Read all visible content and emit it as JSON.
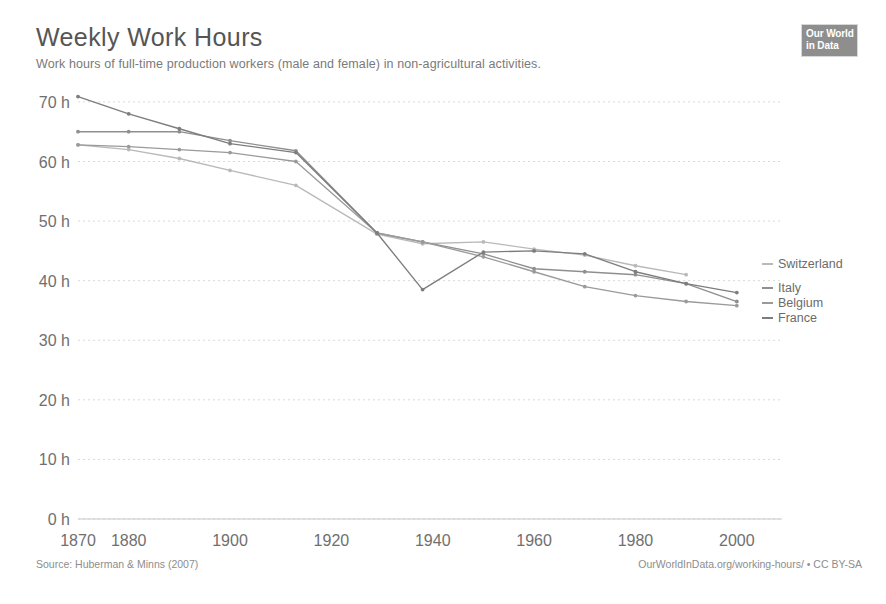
{
  "header": {
    "title": "Weekly Work Hours",
    "subtitle": "Work hours of full-time production workers (male and female) in non-agricultural activities.",
    "logo_line1": "Our World",
    "logo_line2": "in Data"
  },
  "footer": {
    "source": "Source: Huberman & Minns (2007)",
    "note": "OurWorldInData.org/working-hours/ • CC BY-SA"
  },
  "chart_data": {
    "type": "line",
    "title": "Weekly Work Hours",
    "subtitle": "Work hours of full-time production workers (male and female) in non-agricultural activities.",
    "xlabel": "",
    "ylabel": "",
    "xlim": [
      1870,
      2003
    ],
    "ylim": [
      0,
      72
    ],
    "grid": true,
    "legend_position": "right",
    "y_tick_values": [
      0,
      10,
      20,
      30,
      40,
      50,
      60,
      70
    ],
    "y_tick_labels": [
      "0 h",
      "10 h",
      "20 h",
      "30 h",
      "40 h",
      "50 h",
      "60 h",
      "70 h"
    ],
    "x_tick_values": [
      1870,
      1880,
      1900,
      1920,
      1940,
      1960,
      1980,
      2000
    ],
    "x_tick_labels": [
      "1870",
      "1880",
      "1900",
      "1920",
      "1940",
      "1960",
      "1980",
      "2000"
    ],
    "series": [
      {
        "name": "Switzerland",
        "color": "#b9b9b9",
        "x": [
          1870,
          1880,
          1890,
          1900,
          1913,
          1929,
          1938,
          1950,
          1960,
          1970,
          1980,
          1990
        ],
        "values": [
          62.8,
          62.0,
          60.5,
          58.5,
          56.0,
          47.8,
          46.2,
          46.5,
          45.3,
          44.3,
          42.5,
          41.0
        ]
      },
      {
        "name": "Italy",
        "color": "#8f8f8f",
        "x": [
          1870,
          1880,
          1890,
          1900,
          1913,
          1929,
          1938,
          1950,
          1960,
          1970,
          1980,
          1990,
          2000
        ],
        "values": [
          65.0,
          65.0,
          65.0,
          63.5,
          61.8,
          48.0,
          46.5,
          44.5,
          42.0,
          41.5,
          41.0,
          39.5,
          36.5
        ]
      },
      {
        "name": "Belgium",
        "color": "#9a9a9a",
        "x": [
          1870,
          1880,
          1890,
          1900,
          1913,
          1929,
          1938,
          1950,
          1960,
          1970,
          1980,
          1990,
          2000
        ],
        "values": [
          62.8,
          62.5,
          62.0,
          61.5,
          60.0,
          48.0,
          46.5,
          44.0,
          41.5,
          39.0,
          37.5,
          36.5,
          35.8
        ]
      },
      {
        "name": "France",
        "color": "#7d7d7d",
        "x": [
          1870,
          1880,
          1890,
          1900,
          1913,
          1929,
          1938,
          1950,
          1960,
          1970,
          1980,
          1990,
          2000
        ],
        "values": [
          70.9,
          68.0,
          65.5,
          63.0,
          61.5,
          48.0,
          38.5,
          44.8,
          45.0,
          44.5,
          41.5,
          39.5,
          38.0
        ]
      }
    ]
  }
}
